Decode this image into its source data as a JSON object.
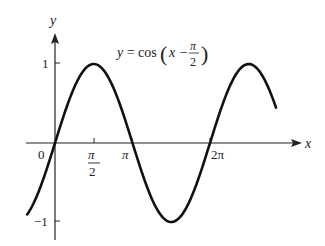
{
  "chart_data": {
    "type": "line",
    "function": "cos(x - pi/2)",
    "xlabel": "x",
    "ylabel": "y",
    "x_ticks": [
      {
        "value": 0,
        "label": "0"
      },
      {
        "value": 1.5708,
        "label": "π/2"
      },
      {
        "value": 3.1416,
        "label": "π"
      },
      {
        "value": 6.2832,
        "label": "2π"
      }
    ],
    "y_ticks": [
      {
        "value": 1,
        "label": "1"
      },
      {
        "value": -1,
        "label": "−1"
      }
    ],
    "xlim": [
      -1.13,
      8.96
    ],
    "ylim": [
      -1.05,
      1.05
    ],
    "series": [
      {
        "name": "y = cos(x − π/2)",
        "x": [
          -1.13,
          0,
          1.5708,
          3.1416,
          4.7124,
          6.2832,
          7.854,
          8.96
        ],
        "values": [
          -0.906,
          0,
          1,
          0,
          -1,
          0,
          1,
          0.447
        ]
      }
    ],
    "grid": false,
    "legend": "none",
    "color": "#111111"
  },
  "labels": {
    "title_lhs": "y = cos",
    "title_x": "x −",
    "title_num": "π",
    "title_den": "2",
    "x_axis": "x",
    "y_axis": "y",
    "origin": "0",
    "pi_half_num": "π",
    "pi_half_den": "2",
    "pi": "π",
    "two_pi": "2π",
    "y_one": "1",
    "y_minus_one": "−1"
  }
}
